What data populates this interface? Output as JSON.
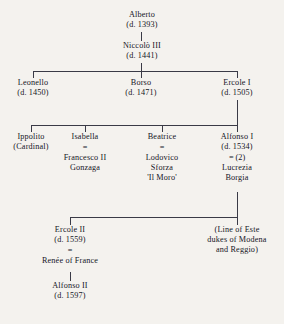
{
  "diagram": {
    "type": "genealogical-tree",
    "text_color": "#15151f",
    "line_color": "#3a3a46",
    "background_color": "#f4f2ee",
    "marriage_symbol": "="
  },
  "nodes": {
    "alberto": {
      "name": "Alberto",
      "death": "(d. 1393)"
    },
    "niccolo": {
      "name": "Niccolò III",
      "death": "(d. 1441)"
    },
    "leonello": {
      "name": "Leonello",
      "death": "(d. 1450)"
    },
    "borso": {
      "name": "Borso",
      "death": "(d. 1471)"
    },
    "ercole1": {
      "name": "Ercole I",
      "death": "(d. 1505)"
    },
    "ippolito": {
      "name": "Ippolito",
      "title": "(Cardinal)"
    },
    "isabella": {
      "name": "Isabella",
      "marriage": "=",
      "spouse_line1": "Francesco II",
      "spouse_line2": "Gonzaga"
    },
    "beatrice": {
      "name": "Beatrice",
      "marriage": "=",
      "spouse_line1": "Lodovico",
      "spouse_line2": "Sforza",
      "spouse_line3": "'Il Moro'"
    },
    "alfonso1": {
      "name": "Alfonso I",
      "death": "(d. 1534)",
      "marriage": "= (2)",
      "spouse_line1": "Lucrezia",
      "spouse_line2": "Borgia"
    },
    "ercole2": {
      "name": "Ercole II",
      "death": "(d. 1559)",
      "marriage": "=",
      "spouse": "Renée of France"
    },
    "alfonso2": {
      "name": "Alfonso II",
      "death": "(d. 1597)"
    },
    "este_line": {
      "line1": "(Line of Este",
      "line2": "dukes of Modena",
      "line3": "and Reggio)"
    }
  }
}
